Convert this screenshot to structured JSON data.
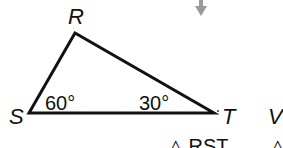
{
  "figure": {
    "vertices": {
      "R": {
        "label": "R"
      },
      "S": {
        "label": "S"
      },
      "T": {
        "label": "T"
      }
    },
    "angles": {
      "S": "60°",
      "T": "30°"
    },
    "extra_vertex_label": "V",
    "captions": [
      "△ RST",
      "△"
    ],
    "colors": {
      "stroke": "#111111",
      "arrow": "#9a9a9a"
    }
  }
}
